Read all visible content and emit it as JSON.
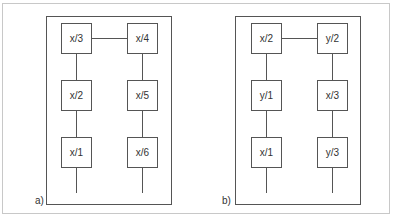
{
  "panels": [
    {
      "label": "a)",
      "boxes": [
        [
          "x/3",
          "x/4"
        ],
        [
          "x/2",
          "x/5"
        ],
        [
          "x/1",
          "x/6"
        ]
      ]
    },
    {
      "label": "b)",
      "boxes": [
        [
          "x/2",
          "y/2"
        ],
        [
          "y/1",
          "x/3"
        ],
        [
          "x/1",
          "y/3"
        ]
      ]
    }
  ]
}
